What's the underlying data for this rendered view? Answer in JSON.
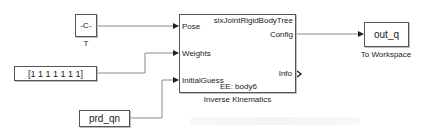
{
  "diagram": {
    "type": "simulink-model",
    "blocks": {
      "constant_T": {
        "value": "-C-",
        "caption": "T"
      },
      "constant_weights": {
        "value": "[1 1 1 1 1 1 1]"
      },
      "from_ws_guess": {
        "value": "prd_qn"
      },
      "inverse_kinematics": {
        "caption": "Inverse Kinematics",
        "rigid_body_tree": "sixJointRigidBodyTree",
        "end_effector": "EE: body6",
        "inputs": [
          "Pose",
          "Weights",
          "InitialGuess"
        ],
        "outputs": [
          "Config",
          "Info"
        ]
      },
      "to_workspace": {
        "value": "out_q",
        "caption": "To Workspace"
      }
    },
    "connections": [
      {
        "from": "constant_T",
        "to": "inverse_kinematics.Pose"
      },
      {
        "from": "constant_weights",
        "to": "inverse_kinematics.Weights"
      },
      {
        "from": "from_ws_guess",
        "to": "inverse_kinematics.InitialGuess"
      },
      {
        "from": "inverse_kinematics.Config",
        "to": "to_workspace"
      }
    ],
    "colors": {
      "line": "#555555",
      "wire": "#8a8a8a",
      "arrow": "#222222"
    }
  }
}
